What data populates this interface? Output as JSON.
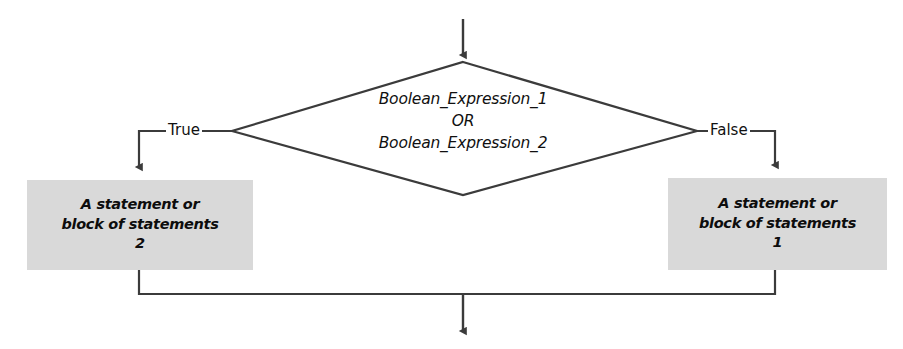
{
  "diagram": {
    "type": "flowchart",
    "title": "",
    "decision": {
      "name": "boolean-expression-decision",
      "text": "Boolean_Expression_1\nOR\nBoolean_Expression_2",
      "line1": "Boolean_Expression_1",
      "line2": "OR",
      "line3": "Boolean_Expression_2",
      "shape": "diamond"
    },
    "branches": {
      "true_label": "True",
      "false_label": "False"
    },
    "process_true": {
      "name": "statement-block-2",
      "text": "A statement or\nblock of statements\n2",
      "line1": "A statement or",
      "line2": "block of statements",
      "line3": "2",
      "shape": "rectangle"
    },
    "process_false": {
      "name": "statement-block-1",
      "text": "A statement or\nblock of statements\n1",
      "line1": "A statement or",
      "line2": "block of statements",
      "line3": "1",
      "shape": "rectangle"
    },
    "colors": {
      "box_fill": "#d9d9d9",
      "stroke": "#3b3b3b",
      "text": "#101010",
      "background": "#ffffff"
    },
    "connectors": {
      "entry_arrow": "down-arrow-into-decision",
      "true_path": "left-then-down-into-statement-block-2",
      "false_path": "right-then-down-into-statement-block-1",
      "merge_path": "both-blocks-merge-then-down-arrow"
    }
  }
}
